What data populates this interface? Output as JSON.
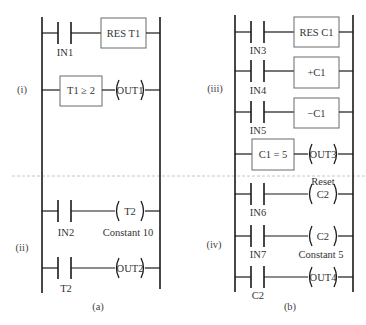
{
  "figure": {
    "panels": [
      {
        "caption": "(a)",
        "sections": [
          {
            "label": "(i)",
            "rungs": [
              {
                "contact": "IN1",
                "output_type": "box",
                "output": "RES T1"
              },
              {
                "condition_box": "T1 ≥ 2",
                "output_type": "coil",
                "output": "OUT1"
              }
            ]
          },
          {
            "label": "(ii)",
            "rungs": [
              {
                "contact": "IN2",
                "output_type": "coil",
                "output": "T2",
                "note_below": "Constant 10"
              },
              {
                "contact": "T2",
                "output_type": "coil",
                "output": "OUT2"
              }
            ]
          }
        ]
      },
      {
        "caption": "(b)",
        "sections": [
          {
            "label": "(iii)",
            "rungs": [
              {
                "contact": "IN3",
                "output_type": "box",
                "output": "RES C1"
              },
              {
                "contact": "IN4",
                "output_type": "box",
                "output": "+C1"
              },
              {
                "contact": "IN5",
                "output_type": "box",
                "output": "−C1"
              },
              {
                "condition_box": "C1 = 5",
                "output_type": "coil",
                "output": "OUT3"
              }
            ]
          },
          {
            "label": "(iv)",
            "rungs": [
              {
                "contact": "IN6",
                "output_type": "coil",
                "output": "C2",
                "note_above": "Reset"
              },
              {
                "contact": "IN7",
                "output_type": "coil",
                "output": "C2",
                "note_below": "Constant 5"
              },
              {
                "contact": "C2",
                "output_type": "coil",
                "output": "OUT4"
              }
            ]
          }
        ]
      }
    ]
  },
  "labels": {
    "a": {
      "caption": "(a)",
      "sec_i": "(i)",
      "sec_ii": "(ii)",
      "in1": "IN1",
      "res_t1": "RES T1",
      "t1_ge_2": "T1 ≥ 2",
      "out1": "OUT1",
      "in2": "IN2",
      "t2_coil": "T2",
      "constant_10": "Constant 10",
      "t2_contact": "T2",
      "out2": "OUT2"
    },
    "b": {
      "caption": "(b)",
      "sec_iii": "(iii)",
      "sec_iv": "(iv)",
      "in3": "IN3",
      "res_c1": "RES C1",
      "in4": "IN4",
      "plus_c1": "+C1",
      "in5": "IN5",
      "minus_c1": "−C1",
      "c1_eq_5": "C1 = 5",
      "out3": "OUT3",
      "reset": "Reset",
      "in6": "IN6",
      "c2_reset_coil": "C2",
      "in7": "IN7",
      "c2_count_coil": "C2",
      "constant_5": "Constant 5",
      "c2_contact": "C2",
      "out4": "OUT4"
    }
  },
  "colors": {
    "line": "#1a1a1a",
    "box_border": "#6b6b6b",
    "text": "#333333",
    "divider": "#b8b8b8"
  }
}
